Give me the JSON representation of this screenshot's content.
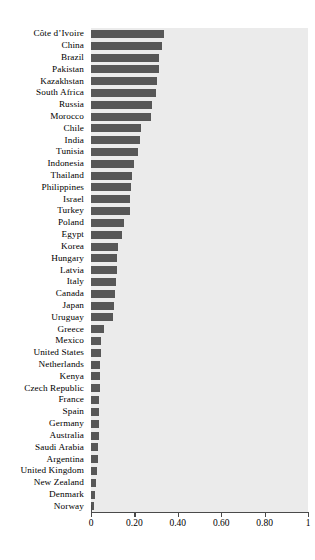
{
  "chart_data": {
    "type": "bar",
    "orientation": "horizontal",
    "title": "",
    "subtitle": "",
    "xlabel": "",
    "ylabel": "",
    "xlim": [
      0,
      1
    ],
    "grid": false,
    "legend": null,
    "bar_color": "#575757",
    "panel_color": "#ebebeb",
    "axis_color": "#4a4a4a",
    "xticks": [
      0,
      0.2,
      0.4,
      0.6,
      0.8,
      1
    ],
    "xtick_labels": [
      "0",
      "0.20",
      "0.40",
      "0.60",
      "0.80",
      "1"
    ],
    "categories": [
      "Côte d’Ivoire",
      "China",
      "Brazil",
      "Pakistan",
      "Kazakhstan",
      "South Africa",
      "Russia",
      "Morocco",
      "Chile",
      "India",
      "Tunisia",
      "Indonesia",
      "Thailand",
      "Philippines",
      "Israel",
      "Turkey",
      "Poland",
      "Egypt",
      "Korea",
      "Hungary",
      "Latvia",
      "Italy",
      "Canada",
      "Japan",
      "Uruguay",
      "Greece",
      "Mexico",
      "United States",
      "Netherlands",
      "Kenya",
      "Czech Republic",
      "France",
      "Spain",
      "Germany",
      "Australia",
      "Saudi Arabia",
      "Argentina",
      "United Kingdom",
      "New Zealand",
      "Denmark",
      "Norway"
    ],
    "values": [
      0.335,
      0.325,
      0.315,
      0.312,
      0.305,
      0.3,
      0.28,
      0.275,
      0.23,
      0.228,
      0.215,
      0.2,
      0.19,
      0.185,
      0.18,
      0.178,
      0.15,
      0.145,
      0.125,
      0.122,
      0.118,
      0.115,
      0.112,
      0.105,
      0.1,
      0.06,
      0.048,
      0.045,
      0.043,
      0.042,
      0.04,
      0.038,
      0.037,
      0.036,
      0.035,
      0.032,
      0.03,
      0.026,
      0.022,
      0.02,
      0.012
    ]
  }
}
